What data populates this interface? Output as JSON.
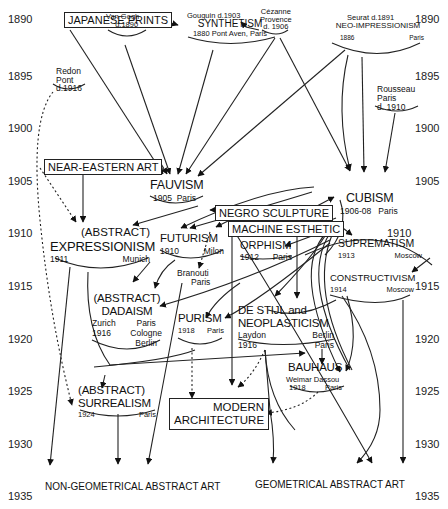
{
  "years": [
    "1890",
    "1895",
    "1900",
    "1905",
    "1910",
    "1915",
    "1920",
    "1925",
    "1930",
    "1935"
  ],
  "sources": {
    "japanese_prints": "JAPANESE PRINTS",
    "near_eastern_art": "NEAR-EASTERN ART",
    "negro_sculpture": "NEGRO SCULPTURE",
    "machine_esthetic": "MACHINE ESTHETIC"
  },
  "artists": {
    "van_gogh": {
      "name": "Van Gogh",
      "note": "d.1890"
    },
    "gauguin": {
      "name": "Gouguin d.1903"
    },
    "cezanne": {
      "name": "Cézanne",
      "place": "Provence",
      "note": "d. 1906"
    },
    "seurat": {
      "name": "Seurat d.1891"
    },
    "redon": {
      "name": "Redon",
      "place": "Pont",
      "note": "d.1916"
    },
    "rousseau": {
      "name": "Rousseau",
      "place": "Paris",
      "note": "d. 1910"
    },
    "brancusi": {
      "name": "Branouti",
      "place": "Paris"
    }
  },
  "movements": {
    "synthetism": {
      "name": "SYNTHETISM",
      "detail": "1880 Pont Aven, Paris"
    },
    "neo_impressionism": {
      "name": "NEO-IMPRESSIONISM",
      "year": "1886",
      "place": "Paris"
    },
    "fauvism": {
      "name": "FAUVISM",
      "year": "1905",
      "place": "Paris"
    },
    "cubism": {
      "name": "CUBISM",
      "year": "1906-08",
      "place": "Paris"
    },
    "expressionism": {
      "prefix": "(ABSTRACT)",
      "name": "EXPRESSIONISM",
      "year": "1911",
      "place": "Munich"
    },
    "futurism": {
      "name": "FUTURISM",
      "year": "1910",
      "place": "Milon"
    },
    "orphism": {
      "name": "ORPHISM",
      "year": "1912",
      "place": "Paris"
    },
    "suprematism": {
      "name": "SUPREMATISM",
      "year": "1913",
      "place": "Moscow"
    },
    "constructivism": {
      "name": "CONSTRUCTIVISM",
      "year": "1914",
      "place": "Moscow"
    },
    "dadaism": {
      "prefix": "(ABSTRACT)",
      "name": "DADAISM",
      "place1": "Zurich",
      "year": "1916",
      "place2": "Paris",
      "place3": "Cologne",
      "place4": "Berlin"
    },
    "purism": {
      "name": "PURISM",
      "year": "1918",
      "place": "Paris"
    },
    "de_stijl": {
      "line1": "DE STIJL and",
      "line2": "NEOPLASTICISM",
      "place1": "Laydon",
      "year": "1916",
      "place2": "Berlin",
      "place3": "Paris"
    },
    "bauhaus": {
      "name": "BAUHAUS",
      "place1": "Weimar",
      "place2": "Dassou",
      "year": "1918",
      "place3": "Paris"
    },
    "surrealism": {
      "prefix": "(ABSTRACT)",
      "name": "SURREALISM",
      "year": "1924",
      "place": "Paris"
    },
    "modern_architecture": {
      "line1": "MODERN",
      "line2": "ARCHITECTURE"
    }
  },
  "outcomes": {
    "non_geometrical": "NON-GEOMETRICAL ABSTRACT ART",
    "geometrical": "GEOMETRICAL ABSTRACT ART"
  }
}
